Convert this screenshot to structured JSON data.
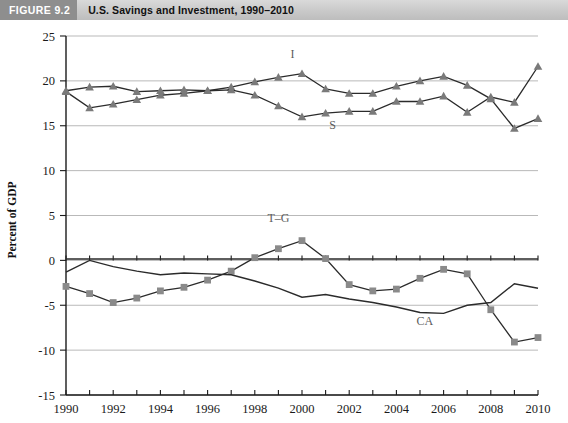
{
  "header": {
    "tag": "FIGURE 9.2",
    "title": "U.S. Savings and Investment, 1990–2010"
  },
  "chart_data": {
    "type": "line",
    "title": "U.S. Savings and Investment, 1990–2010",
    "xlabel": "",
    "ylabel": "Percent of GDP",
    "xlim": [
      1990,
      2010
    ],
    "ylim": [
      -15,
      25
    ],
    "yticks": [
      -15,
      -10,
      -5,
      0,
      5,
      10,
      15,
      20,
      25
    ],
    "xticks": [
      1990,
      1992,
      1994,
      1996,
      1998,
      2000,
      2002,
      2004,
      2006,
      2008,
      2010
    ],
    "xtick_labels": [
      "1990",
      "1992",
      "1994",
      "1996",
      "1998",
      "2000",
      "2002",
      "2004",
      "2006",
      "2008",
      "2010"
    ],
    "ytick_labels": [
      "-15",
      "-10",
      "-5",
      "0",
      "5",
      "10",
      "15",
      "20",
      "25"
    ],
    "grid": true,
    "grid_axis": "y",
    "legend": "inline-annotations",
    "x": [
      1990,
      1991,
      1992,
      1993,
      1994,
      1995,
      1996,
      1997,
      1998,
      1999,
      2000,
      2001,
      2002,
      2003,
      2004,
      2005,
      2006,
      2007,
      2008,
      2009,
      2010
    ],
    "series": [
      {
        "name": "I",
        "label": "I",
        "marker": "triangle",
        "color": "#7a7a7a",
        "values": [
          18.8,
          17.0,
          17.4,
          17.9,
          18.4,
          18.6,
          18.9,
          19.3,
          19.9,
          20.4,
          20.8,
          19.1,
          18.6,
          18.6,
          19.4,
          20.0,
          20.5,
          19.5,
          18.0,
          14.7,
          15.8
        ]
      },
      {
        "name": "S",
        "label": "S",
        "marker": "triangle",
        "color": "#7a7a7a",
        "values": [
          18.9,
          19.3,
          19.4,
          18.8,
          18.9,
          19.0,
          18.9,
          19.0,
          18.4,
          17.2,
          16.0,
          16.4,
          16.6,
          16.6,
          17.7,
          17.7,
          18.3,
          16.5,
          18.2,
          17.6,
          21.6
        ]
      },
      {
        "name": "T–G",
        "label": "T–G",
        "marker": "square",
        "color": "#8a8a8a",
        "values": [
          -2.9,
          -3.7,
          -4.7,
          -4.2,
          -3.4,
          -3.0,
          -2.2,
          -1.2,
          0.3,
          1.3,
          2.2,
          0.2,
          -2.7,
          -3.4,
          -3.2,
          -2.0,
          -1.0,
          -1.5,
          -5.5,
          -9.1,
          -8.6
        ]
      },
      {
        "name": "CA",
        "label": "CA",
        "marker": "none",
        "color": "#2b2b2b",
        "values": [
          -1.3,
          0.0,
          -0.7,
          -1.2,
          -1.6,
          -1.4,
          -1.5,
          -1.6,
          -2.3,
          -3.1,
          -4.1,
          -3.8,
          -4.3,
          -4.7,
          -5.2,
          -5.8,
          -5.9,
          -5.0,
          -4.7,
          -2.6,
          -3.1
        ]
      }
    ],
    "annotations": [
      {
        "text": "I",
        "x": 1999.6,
        "y": 22.6
      },
      {
        "text": "S",
        "x": 2001.3,
        "y": 14.6
      },
      {
        "text": "T–G",
        "x": 1999.0,
        "y": 4.3
      },
      {
        "text": "CA",
        "x": 2005.2,
        "y": -7.2
      }
    ]
  }
}
